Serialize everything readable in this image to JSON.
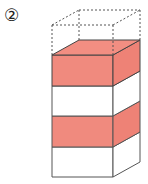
{
  "figure": {
    "label": "②",
    "colors": {
      "red_fill": "#f08a7e",
      "red_side": "#ee8276",
      "red_top": "#f28e82",
      "outline": "#444444",
      "dashed": "#555555",
      "white": "#ffffff"
    },
    "layers": [
      {
        "index": 1,
        "style": "dashed",
        "fill": "none"
      },
      {
        "index": 2,
        "style": "solid",
        "fill": "red"
      },
      {
        "index": 3,
        "style": "solid",
        "fill": "white"
      },
      {
        "index": 4,
        "style": "solid",
        "fill": "red"
      },
      {
        "index": 5,
        "style": "solid",
        "fill": "white"
      }
    ]
  }
}
